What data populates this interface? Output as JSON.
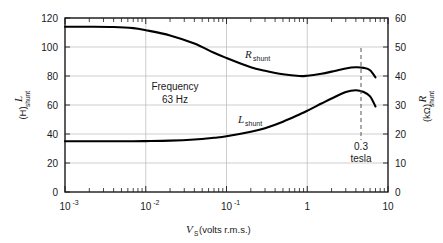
{
  "chart_data": {
    "type": "line",
    "title": "",
    "xlabel": "V_S (volts r.m.s.)",
    "xlabel_symbol": "V",
    "xlabel_subscript": "S",
    "xlabel_rest": " (volts r.m.s.)",
    "xscale": "log",
    "xlim": [
      0.001,
      10
    ],
    "xticks": [
      0.001,
      0.01,
      0.1,
      1,
      10
    ],
    "xticklabels": [
      "10⁻³",
      "10⁻²",
      "10⁻¹",
      "1",
      "10"
    ],
    "xtick_mantissa": [
      "10",
      "10",
      "10",
      "1",
      "10"
    ],
    "xtick_exponent": [
      "-3",
      "-2",
      "-1",
      "",
      ""
    ],
    "grid": true,
    "legend": "none",
    "left_axis": {
      "label_symbol": "L",
      "label_subscript": "shunt",
      "label_units": "(H)",
      "label": "L_shunt (H)",
      "ylim": [
        0,
        120
      ],
      "yticks": [
        0,
        20,
        40,
        60,
        80,
        100,
        120
      ],
      "yticklabels": [
        "0",
        "20",
        "40",
        "60",
        "80",
        "100",
        "120"
      ]
    },
    "right_axis": {
      "label_symbol": "R",
      "label_subscript": "shunt",
      "label_units": "(kΩ)",
      "label": "R_shunt (kΩ)",
      "ylim": [
        0,
        60
      ],
      "yticks": [
        0,
        10,
        20,
        30,
        40,
        50,
        60
      ],
      "yticklabels": [
        "0",
        "10",
        "20",
        "30",
        "40",
        "50",
        "60"
      ]
    },
    "series": [
      {
        "name": "R_shunt",
        "label_symbol": "R",
        "label_subscript": "shunt",
        "axis": "right",
        "units": "kΩ",
        "x": [
          0.001,
          0.002,
          0.004,
          0.007,
          0.01,
          0.02,
          0.04,
          0.07,
          0.1,
          0.2,
          0.3,
          0.5,
          0.8,
          1.0,
          1.5,
          2.0,
          3.0,
          4.0,
          5.0,
          6.0,
          7.0
        ],
        "values": [
          57.0,
          57.0,
          56.9,
          56.5,
          55.8,
          54.0,
          51.2,
          48.0,
          46.2,
          43.0,
          41.8,
          40.6,
          40.0,
          40.1,
          40.8,
          41.5,
          42.6,
          43.0,
          42.8,
          42.0,
          39.5
        ],
        "values_left_scale": [
          114,
          114,
          113.8,
          113,
          111.6,
          108,
          102.4,
          96,
          92.4,
          86,
          83.6,
          81.2,
          80,
          80.2,
          81.6,
          83,
          85.2,
          86,
          85.6,
          84,
          79
        ]
      },
      {
        "name": "L_shunt",
        "label_symbol": "L",
        "label_subscript": "shunt",
        "axis": "left",
        "units": "H",
        "x": [
          0.001,
          0.002,
          0.004,
          0.007,
          0.01,
          0.02,
          0.04,
          0.07,
          0.1,
          0.2,
          0.3,
          0.5,
          0.8,
          1.0,
          1.5,
          2.0,
          3.0,
          4.0,
          5.0,
          6.0,
          7.0
        ],
        "values": [
          35.0,
          35.0,
          35.0,
          35.0,
          35.1,
          35.4,
          36.2,
          37.4,
          38.4,
          41.5,
          44.0,
          48.5,
          53.5,
          56.0,
          61.0,
          64.5,
          69.0,
          70.2,
          69.0,
          66.0,
          59.0
        ]
      }
    ],
    "annotations": [
      {
        "name": "frequency-note",
        "text_line1": "Frequency",
        "text_line2": "63 Hz",
        "x": 0.035,
        "y_left": 72
      },
      {
        "name": "tesla-note",
        "text_line1": "0.3",
        "text_line2": "tesla",
        "x": 7.0,
        "marker": "dashed-vertical-line"
      }
    ]
  },
  "figure": {
    "background_color": "#ffffff",
    "curve_color": "#000000",
    "grid_color": "#b9b9b9",
    "frame_color": "#1a1a1a"
  }
}
